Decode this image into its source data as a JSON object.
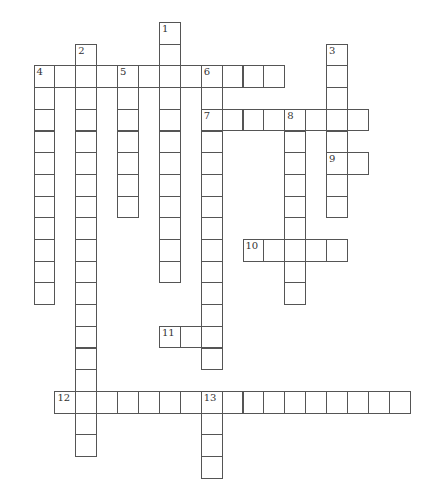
{
  "puzzle": {
    "type": "crossword",
    "grid": {
      "origin_x": 33.5,
      "origin_y": 22,
      "cell_w": 20.9,
      "cell_h": 21.7,
      "line_color": "#555555",
      "cell_fill": "#ffffff"
    },
    "words": [
      {
        "number": "1",
        "direction": "down",
        "col": 6,
        "row": 0,
        "length": 12
      },
      {
        "number": "2",
        "direction": "down",
        "col": 2,
        "row": 1,
        "length": 19
      },
      {
        "number": "3",
        "direction": "down",
        "col": 14,
        "row": 1,
        "length": 8
      },
      {
        "number": "4",
        "direction": "across",
        "col": 0,
        "row": 2,
        "length": 12
      },
      {
        "number": "4",
        "direction": "down",
        "col": 0,
        "row": 2,
        "length": 11
      },
      {
        "number": "5",
        "direction": "down",
        "col": 4,
        "row": 2,
        "length": 7
      },
      {
        "number": "6",
        "direction": "down",
        "col": 8,
        "row": 2,
        "length": 14
      },
      {
        "number": "7",
        "direction": "across",
        "col": 8,
        "row": 4,
        "length": 8
      },
      {
        "number": "8",
        "direction": "down",
        "col": 12,
        "row": 4,
        "length": 9
      },
      {
        "number": "9",
        "direction": "across",
        "col": 14,
        "row": 6,
        "length": 2
      },
      {
        "number": "10",
        "direction": "across",
        "col": 10,
        "row": 10,
        "length": 5
      },
      {
        "number": "11",
        "direction": "across",
        "col": 6,
        "row": 14,
        "length": 3
      },
      {
        "number": "12",
        "direction": "across",
        "col": 1,
        "row": 17,
        "length": 17
      },
      {
        "number": "13",
        "direction": "down",
        "col": 8,
        "row": 17,
        "length": 4
      }
    ]
  }
}
